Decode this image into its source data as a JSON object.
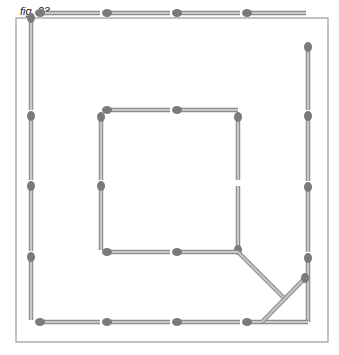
{
  "figure": {
    "label": "fig. 23",
    "frame": {
      "x": 16,
      "y": 18,
      "w": 312,
      "h": 324,
      "stroke": "#9a9a9a"
    },
    "colors": {
      "stick": "#c8c8c8",
      "stick_edge": "#8c8c8c",
      "head": "#7a7a7a"
    },
    "matches": [
      {
        "x1": 40,
        "y1": 12,
        "x2": 100,
        "y2": 12,
        "head": "start"
      },
      {
        "x1": 107,
        "y1": 12,
        "x2": 170,
        "y2": 12,
        "head": "start"
      },
      {
        "x1": 177,
        "y1": 12,
        "x2": 240,
        "y2": 12,
        "head": "start"
      },
      {
        "x1": 247,
        "y1": 12,
        "x2": 306,
        "y2": 12,
        "head": "start"
      },
      {
        "x1": 31,
        "y1": 18,
        "x2": 31,
        "y2": 110,
        "head": "start"
      },
      {
        "x1": 31,
        "y1": 116,
        "x2": 31,
        "y2": 180,
        "head": "start"
      },
      {
        "x1": 31,
        "y1": 186,
        "x2": 31,
        "y2": 251,
        "head": "start"
      },
      {
        "x1": 31,
        "y1": 257,
        "x2": 31,
        "y2": 320,
        "head": "start"
      },
      {
        "x1": 308,
        "y1": 47,
        "x2": 308,
        "y2": 110,
        "head": "start"
      },
      {
        "x1": 308,
        "y1": 116,
        "x2": 308,
        "y2": 181,
        "head": "start"
      },
      {
        "x1": 308,
        "y1": 187,
        "x2": 308,
        "y2": 252,
        "head": "start"
      },
      {
        "x1": 308,
        "y1": 258,
        "x2": 308,
        "y2": 322,
        "head": "start"
      },
      {
        "x1": 40,
        "y1": 322,
        "x2": 100,
        "y2": 322,
        "head": "start"
      },
      {
        "x1": 107,
        "y1": 322,
        "x2": 170,
        "y2": 322,
        "head": "start"
      },
      {
        "x1": 177,
        "y1": 322,
        "x2": 240,
        "y2": 322,
        "head": "start"
      },
      {
        "x1": 247,
        "y1": 322,
        "x2": 308,
        "y2": 322,
        "head": "start"
      },
      {
        "x1": 107,
        "y1": 110,
        "x2": 170,
        "y2": 110,
        "head": "start"
      },
      {
        "x1": 177,
        "y1": 110,
        "x2": 238,
        "y2": 110,
        "head": "start"
      },
      {
        "x1": 101,
        "y1": 117,
        "x2": 101,
        "y2": 180,
        "head": "start"
      },
      {
        "x1": 101,
        "y1": 186,
        "x2": 101,
        "y2": 250,
        "head": "start"
      },
      {
        "x1": 238,
        "y1": 117,
        "x2": 238,
        "y2": 180,
        "head": "start"
      },
      {
        "x1": 238,
        "y1": 186,
        "x2": 238,
        "y2": 250,
        "head": "end"
      },
      {
        "x1": 107,
        "y1": 252,
        "x2": 170,
        "y2": 252,
        "head": "start"
      },
      {
        "x1": 177,
        "y1": 252,
        "x2": 238,
        "y2": 252,
        "head": "start"
      },
      {
        "x1": 238,
        "y1": 252,
        "x2": 285,
        "y2": 299,
        "head": "none"
      },
      {
        "x1": 305,
        "y1": 278,
        "x2": 262,
        "y2": 322,
        "head": "start"
      }
    ]
  }
}
